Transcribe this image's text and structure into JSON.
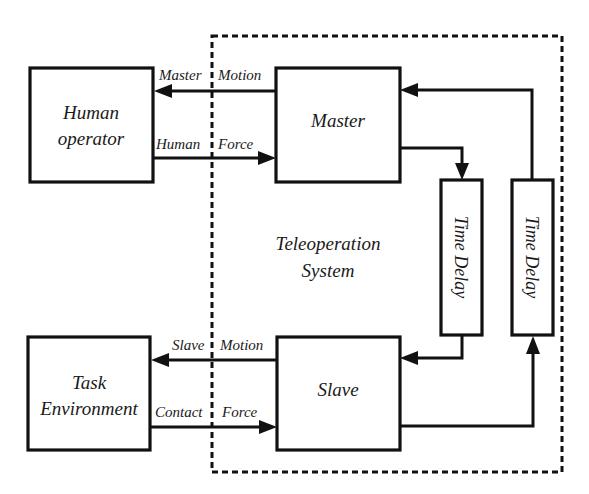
{
  "top_fragment": "",
  "boundary": {
    "label_line1": "Teleoperation",
    "label_line2": "System"
  },
  "blocks": {
    "human_operator": {
      "line1": "Human",
      "line2": "operator"
    },
    "master": {
      "label": "Master"
    },
    "slave": {
      "label": "Slave"
    },
    "task_environment": {
      "line1": "Task",
      "line2": "Environment"
    },
    "time_delay_forward": {
      "label": "Time Delay"
    },
    "time_delay_backward": {
      "label": "Time Delay"
    }
  },
  "signals": {
    "master_motion": {
      "word1": "Master",
      "word2": "Motion"
    },
    "human_force": {
      "word1": "Human",
      "word2": "Force"
    },
    "slave_motion": {
      "word1": "Slave",
      "word2": "Motion"
    },
    "contact_force": {
      "word1": "Contact",
      "word2": "Force"
    }
  },
  "colors": {
    "line": "#111111",
    "text": "#1a1a1a",
    "background": "#ffffff"
  }
}
